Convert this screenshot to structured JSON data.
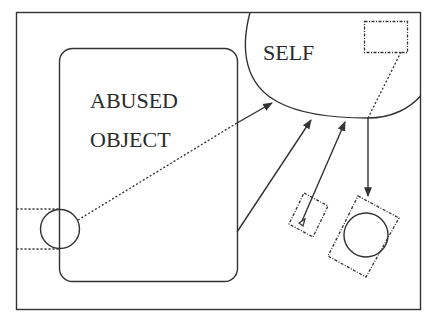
{
  "diagram": {
    "labels": {
      "abused_object_line1": "ABUSED",
      "abused_object_line2": "OBJECT",
      "self": "SELF"
    },
    "nodes": [
      {
        "id": "outer-frame",
        "shape": "rectangle",
        "style": "solid"
      },
      {
        "id": "abused-object",
        "shape": "rounded-rectangle",
        "style": "solid",
        "label": "ABUSED OBJECT"
      },
      {
        "id": "self",
        "shape": "rounded-blob",
        "style": "solid",
        "label": "SELF"
      },
      {
        "id": "boundary-circle",
        "shape": "circle",
        "style": "solid"
      },
      {
        "id": "self-inner-rect",
        "shape": "rectangle",
        "style": "dotted"
      },
      {
        "id": "small-tilted-rect",
        "shape": "rotated-rectangle",
        "style": "dotted"
      },
      {
        "id": "large-tilted-rect",
        "shape": "rotated-rectangle",
        "style": "dotted"
      },
      {
        "id": "projected-circle",
        "shape": "circle",
        "style": "solid"
      }
    ],
    "edges": [
      {
        "from": "boundary-circle",
        "to": "self",
        "style": "dotted-then-solid",
        "arrow": "end"
      },
      {
        "from": "abused-object",
        "to": "self",
        "style": "solid",
        "arrow": "end"
      },
      {
        "from": "small-tilted-rect",
        "to": "self",
        "style": "solid",
        "arrow": "end"
      },
      {
        "from": "self-inner-rect",
        "to": "large-tilted-rect",
        "style": "dotted-then-solid",
        "arrow": "end"
      }
    ],
    "colors": {
      "stroke": "#333333",
      "text": "#2a2a2a",
      "background": "#ffffff"
    }
  }
}
